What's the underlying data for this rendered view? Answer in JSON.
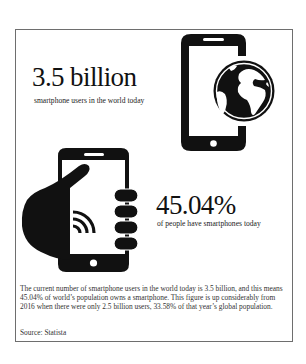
{
  "infographic": {
    "stat1": {
      "value": "3.5 billion",
      "caption": "smartphone users in the world today",
      "icon": "smartphone-globe-icon"
    },
    "stat2": {
      "value": "45.04%",
      "caption": "of people have smartphones today",
      "icon": "hand-holding-smartphone-wireless-icon"
    },
    "description_lines": [
      "The current number of smartphone users in the world today is 3.5 billion, and this means",
      "45.04% of world’s population owns a smartphone. This figure is up considerably from",
      "2016 when there were only 2.5 billion users, 33.58% of that year’s global population."
    ],
    "source": "Source: Statista",
    "colors": {
      "ink": "#111111",
      "border": "#6e6e6e",
      "background": "#ffffff"
    }
  }
}
